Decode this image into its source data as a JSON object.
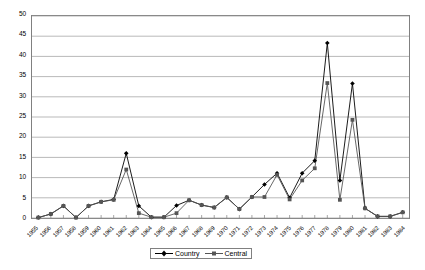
{
  "chart_data": {
    "type": "line",
    "title": "",
    "xlabel": "",
    "ylabel": "",
    "ylim": [
      0,
      50
    ],
    "ytick_step": 5,
    "grid": true,
    "legend_position": "bottom-center",
    "categories": [
      "1955",
      "1956",
      "1957",
      "1958",
      "1959",
      "1960",
      "1961",
      "1962",
      "1963",
      "1964",
      "1965",
      "1966",
      "1967",
      "1968",
      "1969",
      "1970",
      "1971",
      "1972",
      "1973",
      "1974",
      "1975",
      "1976",
      "1977",
      "1978",
      "1979",
      "1980",
      "1981",
      "1982",
      "1983",
      "1984"
    ],
    "yticks": [
      "0",
      "5",
      "10",
      "15",
      "20",
      "25",
      "30",
      "35",
      "40",
      "45",
      "50"
    ],
    "series": [
      {
        "name": "Country",
        "marker": "diamond",
        "color": "#000000",
        "values": [
          0.1,
          1.0,
          3.0,
          0.1,
          3.0,
          4.0,
          4.6,
          16.0,
          3.0,
          0.2,
          0.2,
          3.1,
          4.4,
          3.2,
          2.6,
          5.1,
          2.2,
          5.2,
          8.3,
          11.1,
          5.0,
          11.1,
          14.2,
          43.3,
          9.3,
          33.3,
          2.4,
          0.4,
          0.4,
          1.4
        ]
      },
      {
        "name": "Central",
        "marker": "square",
        "color": "#555555",
        "values": [
          0.1,
          1.0,
          3.0,
          0.1,
          3.0,
          4.0,
          4.5,
          12.0,
          1.2,
          0.2,
          0.2,
          1.2,
          4.4,
          3.2,
          2.6,
          5.1,
          2.2,
          5.2,
          5.2,
          10.7,
          4.6,
          9.3,
          12.3,
          33.4,
          4.5,
          24.3,
          2.4,
          0.4,
          0.4,
          1.4
        ]
      }
    ]
  },
  "legend": {
    "items": [
      {
        "label": "Country"
      },
      {
        "label": "Central"
      }
    ]
  }
}
